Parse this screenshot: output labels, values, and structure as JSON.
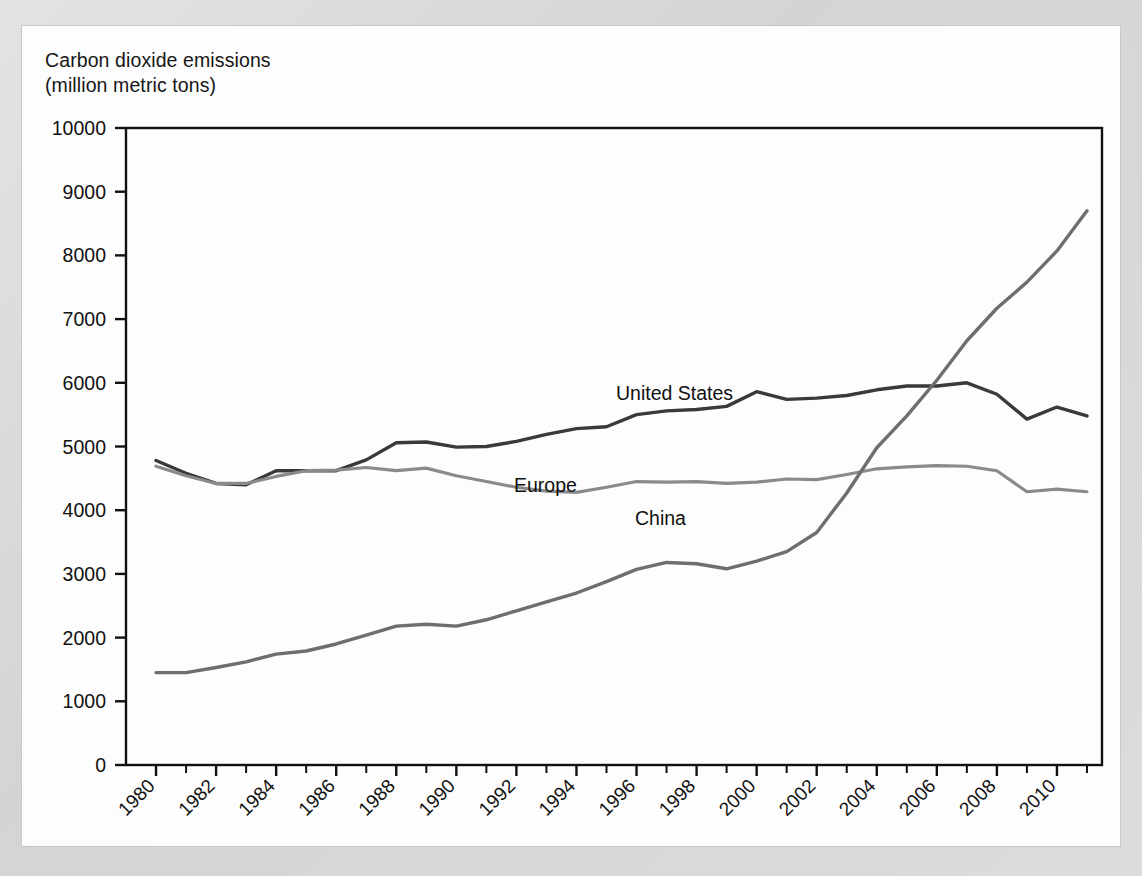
{
  "figure": {
    "background_color": "#d9d9d9",
    "panel_color": "#fdfdfd",
    "axis_color": "#111111"
  },
  "labels": {
    "axis_title_line1": "Carbon dioxide emissions",
    "axis_title_line2": "(million metric tons)",
    "series_united_states": "United States",
    "series_europe": "Europe",
    "series_china": "China"
  },
  "chart_data": {
    "type": "line",
    "xlabel": "",
    "ylabel": "Carbon dioxide emissions (million metric tons)",
    "xlim": [
      1979,
      2011.5
    ],
    "ylim": [
      0,
      10000
    ],
    "grid": false,
    "legend_position": "inline-labels",
    "ytick_labels": [
      "0",
      "1000",
      "2000",
      "3000",
      "4000",
      "5000",
      "6000",
      "7000",
      "8000",
      "9000",
      "10000"
    ],
    "ytick_values": [
      0,
      1000,
      2000,
      3000,
      4000,
      5000,
      6000,
      7000,
      8000,
      9000,
      10000
    ],
    "xtick_labels": [
      "1980",
      "1982",
      "1984",
      "1986",
      "1988",
      "1990",
      "1992",
      "1994",
      "1996",
      "1998",
      "2000",
      "2002",
      "2004",
      "2006",
      "2008",
      "2010"
    ],
    "xtick_values": [
      1980,
      1982,
      1984,
      1986,
      1988,
      1990,
      1992,
      1994,
      1996,
      1998,
      2000,
      2002,
      2004,
      2006,
      2008,
      2010
    ],
    "minor_xticks": [
      1981,
      1983,
      1985,
      1987,
      1989,
      1991,
      1993,
      1995,
      1997,
      1999,
      2001,
      2003,
      2005,
      2007,
      2009,
      2011
    ],
    "x": [
      1980,
      1981,
      1982,
      1983,
      1984,
      1985,
      1986,
      1987,
      1988,
      1989,
      1990,
      1991,
      1992,
      1993,
      1994,
      1995,
      1996,
      1997,
      1998,
      1999,
      2000,
      2001,
      2002,
      2003,
      2004,
      2005,
      2006,
      2007,
      2008,
      2009,
      2010,
      2011
    ],
    "series": [
      {
        "name": "United States",
        "color": "#3a3a3a",
        "line_width": 3.4,
        "values": [
          4780,
          4580,
          4420,
          4400,
          4620,
          4620,
          4620,
          4790,
          5060,
          5070,
          4990,
          5000,
          5080,
          5190,
          5280,
          5310,
          5500,
          5560,
          5580,
          5630,
          5860,
          5740,
          5760,
          5800,
          5890,
          5950,
          5950,
          6000,
          5820,
          5430,
          5620,
          5480
        ]
      },
      {
        "name": "Europe",
        "color": "#8a8a8a",
        "line_width": 3.2,
        "values": [
          4690,
          4540,
          4420,
          4420,
          4530,
          4620,
          4630,
          4670,
          4620,
          4660,
          4540,
          4450,
          4360,
          4300,
          4280,
          4360,
          4450,
          4440,
          4450,
          4420,
          4440,
          4490,
          4480,
          4560,
          4650,
          4680,
          4700,
          4690,
          4620,
          4290,
          4330,
          4290
        ]
      },
      {
        "name": "China",
        "color": "#6e6e6e",
        "line_width": 3.4,
        "values": [
          1450,
          1450,
          1530,
          1620,
          1740,
          1790,
          1900,
          2040,
          2180,
          2210,
          2180,
          2280,
          2420,
          2560,
          2700,
          2880,
          3070,
          3180,
          3160,
          3080,
          3200,
          3350,
          3650,
          4270,
          4980,
          5480,
          6040,
          6660,
          7170,
          7580,
          8070,
          8700
        ]
      }
    ]
  }
}
